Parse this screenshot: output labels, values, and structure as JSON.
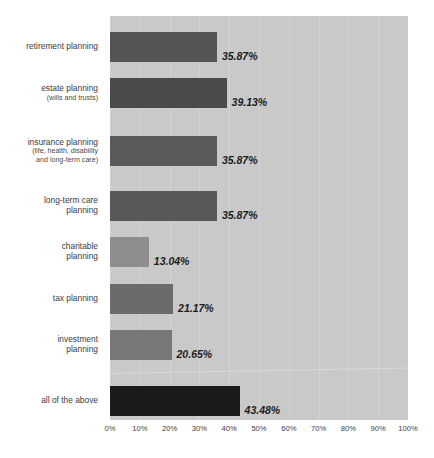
{
  "chart_data": {
    "type": "bar",
    "orientation": "horizontal",
    "title": "",
    "xlabel": "",
    "ylabel": "",
    "xlim": [
      0,
      100
    ],
    "grid": true,
    "legend": "none",
    "categories": [
      "retirement planning",
      "estate planning (wills and trusts)",
      "insurance planning (life, health, disability and long-term care)",
      "long-term care planning",
      "charitable planning",
      "tax planning",
      "investment planning",
      "all of the above"
    ],
    "values": [
      35.87,
      39.13,
      35.87,
      35.87,
      13.04,
      21.17,
      20.65,
      43.48
    ],
    "value_labels": [
      "35.87%",
      "39.13%",
      "35.87%",
      "35.87%",
      "13.04%",
      "21.17%",
      "20.65%",
      "43.48%"
    ],
    "xticks": [
      0,
      10,
      20,
      30,
      40,
      50,
      60,
      70,
      80,
      90,
      100
    ],
    "xtick_labels": [
      "0%",
      "10%",
      "20%",
      "30%",
      "40%",
      "50%",
      "60%",
      "70%",
      "80%",
      "90%",
      "100%"
    ],
    "bar_colors": [
      "#545454",
      "#4a4a4a",
      "#5a5a5a",
      "#585858",
      "#8e8e8e",
      "#6b6b6b",
      "#787878",
      "#1a1a1a"
    ],
    "plot_background": "#c9c9c9",
    "page_background": "#ffffff"
  },
  "categories": [
    {
      "main": "retirement planning",
      "sub": ""
    },
    {
      "main": "estate planning",
      "sub": "(wills and trusts)"
    },
    {
      "main": "insurance planning",
      "sub": "(life, health, disability\nand long-term care)"
    },
    {
      "main": "long-term care",
      "sub": "planning"
    },
    {
      "main": "charitable",
      "sub": "planning"
    },
    {
      "main": "tax planning",
      "sub": ""
    },
    {
      "main": "investment",
      "sub": "planning"
    },
    {
      "main": "all of the above",
      "sub": ""
    }
  ]
}
